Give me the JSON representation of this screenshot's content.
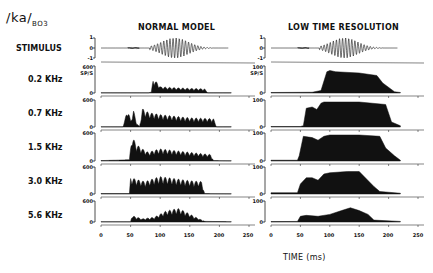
{
  "figure": {
    "title_main": "/ka/",
    "title_sub": "BO3",
    "panels": [
      {
        "title": "NORMAL MODEL"
      },
      {
        "title": "LOW TIME RESOLUTION"
      }
    ],
    "row_labels": [
      "STIMULUS",
      "0.2 KHz",
      "0.7 KHz",
      "1.5 KHz",
      "3.0 KHz",
      "5.6 KHz"
    ],
    "stimulus_ticks": [
      "1",
      "0",
      "-1"
    ],
    "left_rate_ticks": {
      "top": "600",
      "unit": "SP/S",
      "bottom": "0"
    },
    "right_rate_ticks": {
      "top": "100",
      "unit": "SP/S",
      "bottom": "0"
    },
    "x_ticks": [
      "0",
      "50",
      "100",
      "150",
      "200",
      "250"
    ],
    "x_label": "TIME (ms)"
  },
  "chart_data": [
    {
      "type": "area",
      "title": "NORMAL MODEL",
      "xlabel": "TIME (ms)",
      "ylabel": "SP/S",
      "xlim": [
        0,
        250
      ],
      "ylim": [
        0,
        600
      ],
      "x_ticks": [
        0,
        50,
        100,
        150,
        200,
        250
      ],
      "series": [
        {
          "name": "STIMULUS",
          "ylim": [
            -1,
            1
          ],
          "description": "waveform: low burst 45-65 ms, voiced oscillation ~85-185 ms, peak amplitude ~1 near 115-130 ms"
        },
        {
          "name": "0.2 KHz",
          "x": [
            0,
            80,
            85,
            88,
            95,
            100,
            120,
            150,
            175,
            180,
            220
          ],
          "values": [
            5,
            5,
            20,
            330,
            250,
            150,
            130,
            110,
            100,
            5,
            5
          ]
        },
        {
          "name": "0.7 KHz",
          "x": [
            0,
            37,
            40,
            45,
            50,
            55,
            60,
            65,
            70,
            80,
            100,
            150,
            190,
            195,
            220
          ],
          "values": [
            5,
            5,
            150,
            450,
            150,
            400,
            100,
            5,
            440,
            350,
            300,
            220,
            200,
            5,
            5
          ]
        },
        {
          "name": "1.5 KHz",
          "x": [
            0,
            30,
            48,
            52,
            60,
            70,
            80,
            90,
            100,
            150,
            185,
            190,
            220
          ],
          "values": [
            10,
            20,
            30,
            580,
            380,
            280,
            200,
            250,
            280,
            200,
            150,
            10,
            5
          ]
        },
        {
          "name": "3.0 KHz",
          "x": [
            0,
            48,
            50,
            60,
            75,
            90,
            100,
            120,
            150,
            170,
            175,
            220
          ],
          "values": [
            10,
            10,
            400,
            350,
            300,
            380,
            420,
            380,
            320,
            300,
            10,
            5
          ]
        },
        {
          "name": "5.6 KHz",
          "x": [
            0,
            50,
            52,
            70,
            90,
            110,
            130,
            140,
            160,
            175,
            220
          ],
          "values": [
            10,
            10,
            200,
            100,
            150,
            350,
            430,
            350,
            150,
            20,
            10
          ]
        }
      ]
    },
    {
      "type": "area",
      "title": "LOW TIME RESOLUTION",
      "xlabel": "TIME (ms)",
      "ylabel": "SP/S",
      "xlim": [
        0,
        250
      ],
      "ylim": [
        0,
        100
      ],
      "x_ticks": [
        0,
        50,
        100,
        150,
        200,
        250
      ],
      "series": [
        {
          "name": "STIMULUS",
          "ylim": [
            -1,
            1
          ],
          "description": "same stimulus waveform as normal model"
        },
        {
          "name": "0.2 KHz",
          "x": [
            0,
            70,
            85,
            95,
            100,
            110,
            150,
            180,
            190,
            210,
            220
          ],
          "values": [
            2,
            3,
            10,
            85,
            90,
            85,
            80,
            70,
            40,
            5,
            2
          ]
        },
        {
          "name": "0.7 KHz",
          "x": [
            0,
            50,
            55,
            60,
            70,
            78,
            85,
            90,
            100,
            150,
            195,
            205,
            220
          ],
          "values": [
            2,
            2,
            5,
            75,
            80,
            70,
            95,
            100,
            100,
            100,
            90,
            20,
            5
          ]
        },
        {
          "name": "1.5 KHz",
          "x": [
            0,
            45,
            48,
            55,
            70,
            80,
            90,
            100,
            150,
            185,
            195,
            210,
            220
          ],
          "values": [
            3,
            3,
            20,
            95,
            90,
            80,
            95,
            100,
            100,
            95,
            50,
            20,
            3
          ]
        },
        {
          "name": "3.0 KHz",
          "x": [
            0,
            45,
            50,
            60,
            70,
            80,
            90,
            100,
            130,
            150,
            175,
            185,
            220
          ],
          "values": [
            5,
            5,
            40,
            65,
            65,
            55,
            80,
            85,
            90,
            90,
            30,
            10,
            3
          ]
        },
        {
          "name": "5.6 KHz",
          "x": [
            0,
            45,
            50,
            60,
            80,
            100,
            120,
            135,
            150,
            165,
            175,
            220
          ],
          "values": [
            2,
            3,
            30,
            35,
            30,
            40,
            60,
            75,
            60,
            40,
            10,
            3
          ]
        }
      ]
    }
  ]
}
